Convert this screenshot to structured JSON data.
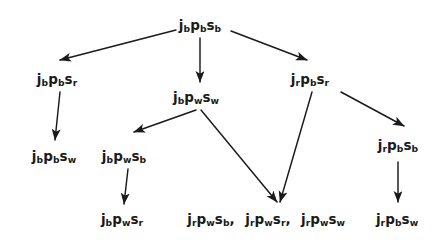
{
  "diagram": {
    "type": "directed-graph",
    "title": "",
    "background_color": "#ffffff",
    "node_color": "#1a1a1a",
    "edge_color": "#1a1a1a",
    "width": 444,
    "height": 249,
    "nodes": [
      {
        "id": "n0",
        "text": "jbpbsb",
        "parts": [
          {
            "base": "j",
            "sub": "b"
          },
          {
            "base": "p",
            "sub": "b"
          },
          {
            "base": "s",
            "sub": "b"
          }
        ],
        "x": 200,
        "y": 26,
        "row": 0
      },
      {
        "id": "n1",
        "text": "jbpbsr",
        "parts": [
          {
            "base": "j",
            "sub": "b"
          },
          {
            "base": "p",
            "sub": "b"
          },
          {
            "base": "s",
            "sub": "r"
          }
        ],
        "x": 57,
        "y": 80,
        "row": 1
      },
      {
        "id": "n2",
        "text": "jbpwsw",
        "parts": [
          {
            "base": "j",
            "sub": "b"
          },
          {
            "base": "p",
            "sub": "w"
          },
          {
            "base": "s",
            "sub": "w"
          }
        ],
        "x": 196,
        "y": 98,
        "row": 1
      },
      {
        "id": "n3",
        "text": "jrpbsr",
        "parts": [
          {
            "base": "j",
            "sub": "r"
          },
          {
            "base": "p",
            "sub": "b"
          },
          {
            "base": "s",
            "sub": "r"
          }
        ],
        "x": 310,
        "y": 80,
        "row": 1
      },
      {
        "id": "n4",
        "text": "jbpbsw",
        "parts": [
          {
            "base": "j",
            "sub": "b"
          },
          {
            "base": "p",
            "sub": "b"
          },
          {
            "base": "s",
            "sub": "w"
          }
        ],
        "x": 54,
        "y": 157,
        "row": 2
      },
      {
        "id": "n5",
        "text": "jbpwsb",
        "parts": [
          {
            "base": "j",
            "sub": "b"
          },
          {
            "base": "p",
            "sub": "w"
          },
          {
            "base": "s",
            "sub": "b"
          }
        ],
        "x": 124,
        "y": 157,
        "row": 2
      },
      {
        "id": "n6",
        "text": "jrpbsb",
        "parts": [
          {
            "base": "j",
            "sub": "r"
          },
          {
            "base": "p",
            "sub": "b"
          },
          {
            "base": "s",
            "sub": "b"
          }
        ],
        "x": 398,
        "y": 146,
        "row": 2
      },
      {
        "id": "n7",
        "text": "jbpwsr",
        "parts": [
          {
            "base": "j",
            "sub": "b"
          },
          {
            "base": "p",
            "sub": "w"
          },
          {
            "base": "s",
            "sub": "r"
          }
        ],
        "x": 122,
        "y": 220,
        "row": 3
      },
      {
        "id": "n8",
        "text": "jrpwsb,",
        "parts": [
          {
            "base": "j",
            "sub": "r"
          },
          {
            "base": "p",
            "sub": "w"
          },
          {
            "base": "s",
            "sub": "b"
          }
        ],
        "trailing": ",",
        "x": 211,
        "y": 220,
        "row": 3
      },
      {
        "id": "n9",
        "text": "jrpwsr,",
        "parts": [
          {
            "base": "j",
            "sub": "r"
          },
          {
            "base": "p",
            "sub": "w"
          },
          {
            "base": "s",
            "sub": "r"
          }
        ],
        "trailing": ",",
        "x": 268,
        "y": 220,
        "row": 3
      },
      {
        "id": "n10",
        "text": "jrpwsw",
        "parts": [
          {
            "base": "j",
            "sub": "r"
          },
          {
            "base": "p",
            "sub": "w"
          },
          {
            "base": "s",
            "sub": "w"
          }
        ],
        "x": 323,
        "y": 220,
        "row": 3
      },
      {
        "id": "n11",
        "text": "jrpbsw",
        "parts": [
          {
            "base": "j",
            "sub": "r"
          },
          {
            "base": "p",
            "sub": "b"
          },
          {
            "base": "s",
            "sub": "w"
          }
        ],
        "x": 397,
        "y": 220,
        "row": 3
      }
    ],
    "edges": [
      {
        "id": "e0",
        "from": "n0",
        "to": "n1",
        "d": "M 176 30 L 60 60",
        "label": ""
      },
      {
        "id": "e1",
        "from": "n0",
        "to": "n2",
        "d": "M 200 38 L 200 82",
        "label": ""
      },
      {
        "id": "e2",
        "from": "n0",
        "to": "n3",
        "d": "M 231 31 L 307 60",
        "label": ""
      },
      {
        "id": "e3",
        "from": "n1",
        "to": "n4",
        "d": "M 60 92 L 55 140",
        "label": ""
      },
      {
        "id": "e4",
        "from": "n2",
        "to": "n5",
        "d": "M 196 110 L 134 132",
        "label": ""
      },
      {
        "id": "e5",
        "from": "n2",
        "to": "n9",
        "d": "M 201 110 L 277 202",
        "label": ""
      },
      {
        "id": "e6",
        "from": "n3",
        "to": "n9",
        "d": "M 312 92 L 280 202",
        "label": ""
      },
      {
        "id": "e7",
        "from": "n3",
        "to": "n6",
        "d": "M 341 92 L 404 126",
        "label": ""
      },
      {
        "id": "e8",
        "from": "n5",
        "to": "n7",
        "d": "M 128 169 L 124 204",
        "label": ""
      },
      {
        "id": "e9",
        "from": "n6",
        "to": "n11",
        "d": "M 398 162 L 398 202",
        "label": ""
      }
    ]
  }
}
